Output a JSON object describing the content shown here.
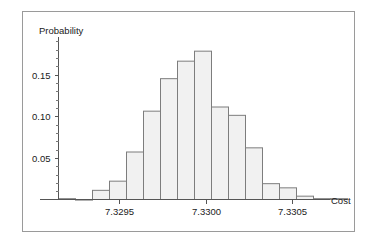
{
  "chart_data": {
    "type": "bar",
    "title": "",
    "subtitle": "",
    "xlabel": "Cost",
    "ylabel": "Probability",
    "grid": false,
    "legend": false,
    "legend_position": "none",
    "bar_style": {
      "fill": "#f1f1f1",
      "edge": "#7d7d7d",
      "bar_width_px": 17,
      "gap": 0
    },
    "xlim": [
      7.32915,
      7.33082
    ],
    "ylim": [
      0,
      0.195
    ],
    "xtick_labels": [
      "7.3295",
      "7.3300",
      "7.3305"
    ],
    "xtick_values": [
      7.3295,
      7.33,
      7.3305
    ],
    "ytick_labels": [
      "0.05",
      "0.10",
      "0.15"
    ],
    "ytick_values": [
      0.05,
      0.1,
      0.15
    ],
    "yminor_step": 0.01,
    "categories": [
      "7.32915",
      "7.32925",
      "7.32935",
      "7.32945",
      "7.32955",
      "7.32965",
      "7.32975",
      "7.32985",
      "7.32995",
      "7.33005",
      "7.33015",
      "7.33025",
      "7.33035",
      "7.33045",
      "7.33055",
      "7.33065",
      "7.33075"
    ],
    "values": [
      0.001,
      0.0,
      0.011,
      0.022,
      0.057,
      0.106,
      0.145,
      0.166,
      0.178,
      0.111,
      0.101,
      0.062,
      0.019,
      0.014,
      0.004,
      0.001,
      0.001
    ]
  },
  "axes": {
    "y_title": "Probability",
    "x_title": "Cost"
  }
}
